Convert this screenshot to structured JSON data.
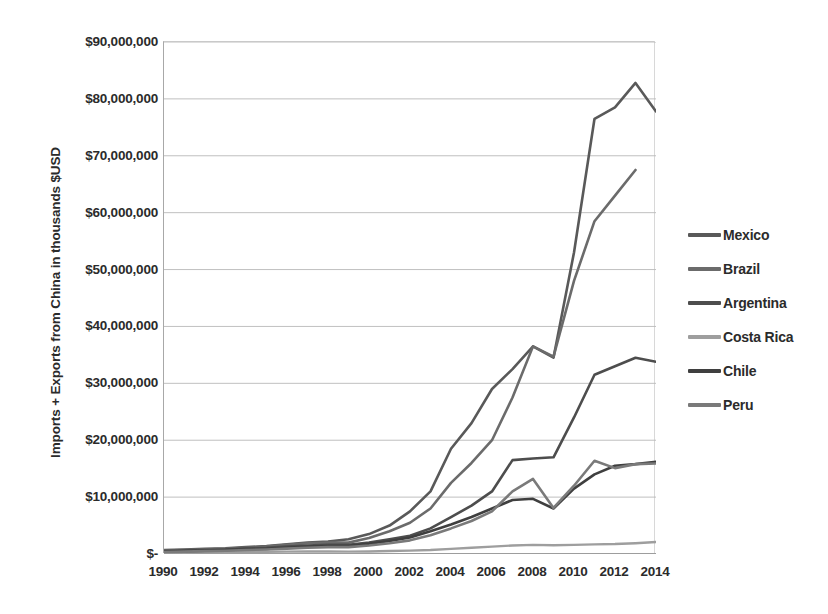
{
  "chart_data": {
    "type": "line",
    "title": "",
    "xlabel": "",
    "ylabel": "Imports + Exports from China in thousands $USD",
    "x": [
      1990,
      1991,
      1992,
      1993,
      1994,
      1995,
      1996,
      1997,
      1998,
      1999,
      2000,
      2001,
      2002,
      2003,
      2004,
      2005,
      2006,
      2007,
      2008,
      2009,
      2010,
      2011,
      2012,
      2013,
      2014
    ],
    "xlim": [
      1990,
      2014
    ],
    "ylim": [
      0,
      90000000
    ],
    "ytick_values": [
      0,
      10000000,
      20000000,
      30000000,
      40000000,
      50000000,
      60000000,
      70000000,
      80000000,
      90000000
    ],
    "ytick_labels": [
      "$-",
      "$10,000,000",
      "$20,000,000",
      "$30,000,000",
      "$40,000,000",
      "$50,000,000",
      "$60,000,000",
      "$70,000,000",
      "$80,000,000",
      "$90,000,000"
    ],
    "xtick_labels": [
      "1990",
      "1992",
      "1994",
      "1996",
      "1998",
      "2000",
      "2002",
      "2004",
      "2006",
      "2008",
      "2010",
      "2012",
      "2014"
    ],
    "xtick_values": [
      1990,
      1992,
      1994,
      1996,
      1998,
      2000,
      2002,
      2004,
      2006,
      2008,
      2010,
      2012,
      2014
    ],
    "grid": "horizontal",
    "legend_position": "right",
    "series": [
      {
        "name": "Mexico",
        "color": "#595959",
        "width": 2.6,
        "values": [
          700000,
          800000,
          900000,
          1000000,
          1200000,
          1400000,
          1700000,
          2000000,
          2200000,
          2600000,
          3500000,
          5000000,
          7500000,
          11000000,
          18500000,
          23000000,
          29000000,
          32500000,
          36500000,
          34500000,
          53000000,
          76500000,
          78500000,
          82800000,
          77800000
        ]
      },
      {
        "name": "Brazil",
        "color": "#6b6b6b",
        "width": 2.6,
        "values": [
          600000,
          700000,
          800000,
          900000,
          1100000,
          1300000,
          1600000,
          1900000,
          2000000,
          2000000,
          2800000,
          4000000,
          5500000,
          8000000,
          12500000,
          16000000,
          20000000,
          27500000,
          36500000,
          34700000,
          48000000,
          58500000,
          63000000,
          67500000,
          null
        ]
      },
      {
        "name": "Argentina",
        "color": "#4d4d4d",
        "width": 2.6,
        "values": [
          500000,
          600000,
          700000,
          800000,
          1000000,
          1100000,
          1300000,
          1500000,
          1600000,
          1600000,
          2000000,
          2600000,
          3200000,
          4500000,
          6500000,
          8500000,
          11000000,
          16500000,
          16800000,
          17000000,
          24000000,
          31500000,
          33000000,
          34500000,
          33800000
        ]
      },
      {
        "name": "Costa Rica",
        "color": "#9e9e9e",
        "width": 2.4,
        "values": [
          200000,
          250000,
          300000,
          320000,
          350000,
          380000,
          420000,
          450000,
          430000,
          420000,
          450000,
          520000,
          600000,
          700000,
          900000,
          1100000,
          1300000,
          1500000,
          1600000,
          1550000,
          1600000,
          1700000,
          1750000,
          1900000,
          2100000
        ]
      },
      {
        "name": "Chile",
        "color": "#3f3f3f",
        "width": 2.6,
        "values": [
          400000,
          500000,
          600000,
          700000,
          800000,
          900000,
          1100000,
          1300000,
          1400000,
          1400000,
          1800000,
          2300000,
          2900000,
          4000000,
          5200000,
          6500000,
          8000000,
          9500000,
          9700000,
          8000000,
          11500000,
          14000000,
          15500000,
          15800000,
          16200000
        ]
      },
      {
        "name": "Peru",
        "color": "#7a7a7a",
        "width": 2.6,
        "values": [
          350000,
          420000,
          500000,
          580000,
          700000,
          800000,
          950000,
          1100000,
          1200000,
          1200000,
          1500000,
          1900000,
          2400000,
          3300000,
          4500000,
          5800000,
          7500000,
          11000000,
          13200000,
          8100000,
          12000000,
          16400000,
          15100000,
          15800000,
          15900000
        ]
      }
    ]
  },
  "legend": {
    "items": [
      {
        "label": "Mexico"
      },
      {
        "label": "Brazil"
      },
      {
        "label": "Argentina"
      },
      {
        "label": "Costa Rica"
      },
      {
        "label": "Chile"
      },
      {
        "label": "Peru"
      }
    ]
  }
}
